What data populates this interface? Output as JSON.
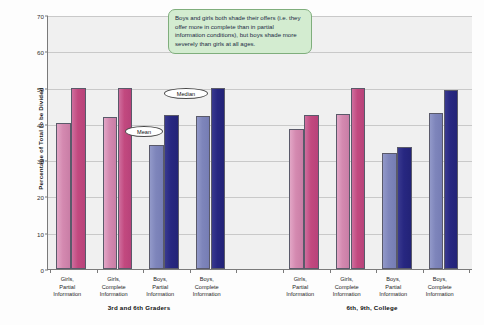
{
  "chart_data": {
    "type": "bar",
    "title": "",
    "xlabel": "",
    "ylabel": "Percentage of Total to be Divided",
    "ylim": [
      0,
      70
    ],
    "yticks": [
      0,
      10,
      20,
      30,
      40,
      50,
      60,
      70
    ],
    "grid": true,
    "legend_position": "none",
    "groups": [
      {
        "name": "3rd and 6th Graders",
        "categories": [
          "Girls,\nPartial\nInformation",
          "Girls,\nComplete\nInformation",
          "Boys,\nPartial\nInformation",
          "Boys,\nComplete\nInformation"
        ],
        "series": [
          {
            "name": "Mean",
            "values": [
              40.3,
              42.0,
              34.3,
              42.3
            ]
          },
          {
            "name": "Median",
            "values": [
              50.0,
              50.0,
              42.5,
              50.0
            ]
          }
        ]
      },
      {
        "name": "6th, 9th, College",
        "categories": [
          "Girls,\nPartial\nInformation",
          "Girls,\nComplete\nInformation",
          "Boys,\nPartial\nInformation",
          "Boys,\nComplete\nInformation"
        ],
        "series": [
          {
            "name": "Mean",
            "values": [
              38.7,
              42.8,
              32.0,
              43.0
            ]
          },
          {
            "name": "Median",
            "values": [
              42.5,
              50.0,
              33.5,
              49.3
            ]
          }
        ]
      }
    ],
    "annotations": [
      {
        "name": "mean-callout",
        "text": "Mean"
      },
      {
        "name": "median-callout",
        "text": "Median"
      },
      {
        "name": "note",
        "text": "Boys and girls both shade their offers (i.e. they offer more in complete than in partial information conditions), but boys shade more severely than girls at all ages."
      }
    ],
    "colors": {
      "girls_mean": "#d489b0",
      "girls_median": "#c2497f",
      "boys_mean": "#7e85bb",
      "boys_median": "#272781",
      "plot_background": "#f0f0f0",
      "gridline": "#c9c9c9",
      "axis": "#7a7a7a",
      "note_background": "#d3ecd0",
      "note_border": "#7fae7c"
    }
  }
}
